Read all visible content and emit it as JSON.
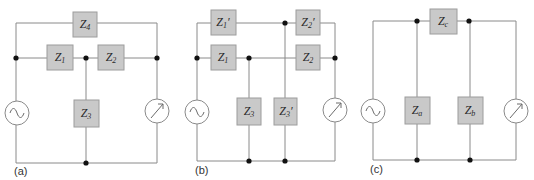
{
  "colors": {
    "background": "#ffffff",
    "wire": "#8a8a8a",
    "impedance_fill": "#c9c9c9",
    "impedance_border": "#9c9c9c",
    "junction_dot": "#111111"
  },
  "diagrams": [
    {
      "caption": "(a)",
      "components": {
        "z4": {
          "symbol": "Z",
          "sub": "4",
          "prime": ""
        },
        "z1": {
          "symbol": "Z",
          "sub": "1",
          "prime": ""
        },
        "z2": {
          "symbol": "Z",
          "sub": "2",
          "prime": ""
        },
        "z3": {
          "symbol": "Z",
          "sub": "3",
          "prime": ""
        }
      },
      "source": "ac-source-icon",
      "meter": "meter-icon"
    },
    {
      "caption": "(b)",
      "components": {
        "z1p": {
          "symbol": "Z",
          "sub": "1",
          "prime": "′"
        },
        "z2p": {
          "symbol": "Z",
          "sub": "2",
          "prime": "′"
        },
        "z1": {
          "symbol": "Z",
          "sub": "1",
          "prime": ""
        },
        "z2": {
          "symbol": "Z",
          "sub": "2",
          "prime": ""
        },
        "z3": {
          "symbol": "Z",
          "sub": "3",
          "prime": ""
        },
        "z3p": {
          "symbol": "Z",
          "sub": "3",
          "prime": "′"
        }
      },
      "source": "ac-source-icon",
      "meter": "meter-icon"
    },
    {
      "caption": "(c)",
      "components": {
        "zc": {
          "symbol": "Z",
          "sub": "c",
          "prime": ""
        },
        "za": {
          "symbol": "Z",
          "sub": "a",
          "prime": ""
        },
        "zb": {
          "symbol": "Z",
          "sub": "b",
          "prime": ""
        }
      },
      "source": "ac-source-icon",
      "meter": "meter-icon"
    }
  ]
}
